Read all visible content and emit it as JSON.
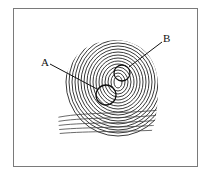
{
  "figure": {
    "labels": [
      {
        "id": "A",
        "text": "A"
      },
      {
        "id": "B",
        "text": "B"
      }
    ],
    "colors": {
      "ink": "#1a1a1a",
      "frame": "#7a7a7a",
      "background": "#ffffff"
    }
  }
}
